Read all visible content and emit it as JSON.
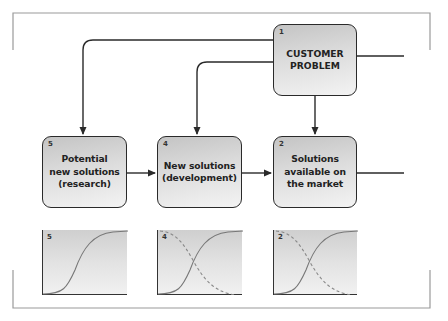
{
  "diagram": {
    "boxes": [
      {
        "id": "customer-problem",
        "number": "1",
        "label": "CUSTOMER\nPROBLEM"
      },
      {
        "id": "solutions-market",
        "number": "2",
        "label": "Solutions\navailable on\nthe market"
      },
      {
        "id": "new-solutions",
        "number": "4",
        "label": "New solutions\n(development)"
      },
      {
        "id": "potential-solutions",
        "number": "5",
        "label": "Potential\nnew solutions\n(research)"
      }
    ],
    "panels": [
      {
        "id": "panel-5",
        "number": "5",
        "curves": [
          "rising"
        ]
      },
      {
        "id": "panel-4",
        "number": "4",
        "curves": [
          "rising",
          "falling-dashed"
        ]
      },
      {
        "id": "panel-2",
        "number": "2",
        "curves": [
          "rising",
          "falling-dashed"
        ]
      }
    ],
    "connections": [
      {
        "from": "1",
        "to": "5",
        "type": "arrow"
      },
      {
        "from": "1",
        "to": "4",
        "type": "arrow"
      },
      {
        "from": "1",
        "to": "2",
        "type": "arrow"
      },
      {
        "from": "5",
        "to": "4",
        "type": "arrow"
      },
      {
        "from": "4",
        "to": "2",
        "type": "arrow"
      },
      {
        "from": "1",
        "to": "right-edge",
        "type": "line"
      },
      {
        "from": "2",
        "to": "right-edge",
        "type": "line"
      }
    ],
    "colors": {
      "line": "#2a2a2a",
      "frame": "#9a9a9a",
      "box_fill_top": "#c4c4c4",
      "box_fill_bottom": "#f3f3f3"
    }
  }
}
